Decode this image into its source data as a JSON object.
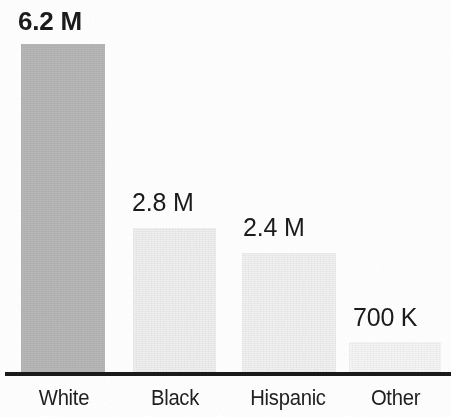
{
  "chart_data": {
    "type": "bar",
    "title": "",
    "subtitle": "",
    "xlabel": "",
    "ylabel": "",
    "grid": false,
    "legend": false,
    "categories": [
      "White",
      "Black",
      "Hispanic",
      "Other"
    ],
    "values": [
      6200000,
      2800000,
      2400000,
      700000
    ],
    "value_labels": [
      "6.2 M",
      "2.8 M",
      "2.4 M",
      "700 K"
    ],
    "ylim": [
      0,
      7000000
    ],
    "bars": [
      {
        "category": "White",
        "value": 6200000,
        "value_label": "6.2 M",
        "color": "#b9b9b9",
        "emphasis": true,
        "x": 21,
        "width": 84,
        "top": 44
      },
      {
        "category": "Black",
        "value": 2800000,
        "value_label": "2.8 M",
        "color": "#f1f1f1",
        "emphasis": false,
        "x": 133,
        "width": 83,
        "top": 228
      },
      {
        "category": "Hispanic",
        "value": 2400000,
        "value_label": "2.4 M",
        "color": "#f3f3f3",
        "emphasis": false,
        "x": 242,
        "width": 94,
        "top": 253
      },
      {
        "category": "Other",
        "value": 700000,
        "value_label": "700 K",
        "color": "#f7f7f7",
        "emphasis": false,
        "x": 349,
        "width": 92,
        "top": 342
      }
    ],
    "axis_color": "#1a1a1a",
    "label_color": "#1f1f1f",
    "background_color": "#ffffff"
  },
  "value_label_positions": [
    {
      "left": 18,
      "top": 6,
      "font_size": 26
    },
    {
      "left": 132,
      "top": 188,
      "font_size": 25
    },
    {
      "left": 243,
      "top": 213,
      "font_size": 25
    },
    {
      "left": 353,
      "top": 303,
      "font_size": 25
    }
  ],
  "tick_label_positions": [
    {
      "left": 19,
      "width": 90
    },
    {
      "left": 130,
      "width": 90
    },
    {
      "left": 233,
      "width": 110
    },
    {
      "left": 348,
      "width": 95
    }
  ]
}
